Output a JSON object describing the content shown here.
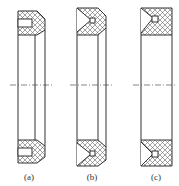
{
  "figure": {
    "type": "technical-drawing",
    "line_color": "#333333",
    "hatch_color": "#555555",
    "background": "#ffffff"
  },
  "panels": [
    {
      "id": "a",
      "label": "(a)"
    },
    {
      "id": "b",
      "label": "(b)"
    },
    {
      "id": "c",
      "label": "(c)"
    }
  ]
}
